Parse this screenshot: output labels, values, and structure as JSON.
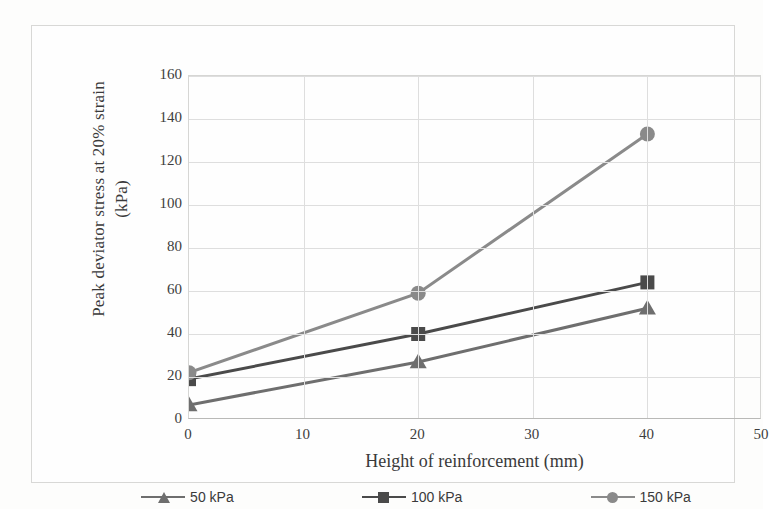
{
  "chart_data": {
    "type": "line",
    "title": "",
    "xlabel": "Height of reinforcement (mm)",
    "ylabel": "Peak deviator stress at  20% strain (kPa)",
    "ylabel_line1": "Peak deviator stress at  20% strain",
    "ylabel_line2": "(kPa)",
    "x": [
      0,
      20,
      40
    ],
    "xlim": [
      0,
      50
    ],
    "ylim": [
      0,
      160
    ],
    "xticks": [
      0,
      10,
      20,
      30,
      40,
      50
    ],
    "yticks": [
      0,
      20,
      40,
      60,
      80,
      100,
      120,
      140,
      160
    ],
    "grid": "horizontal-and-vertical",
    "legend_position": "bottom",
    "series": [
      {
        "name": "50 kPa",
        "marker": "triangle",
        "color": "#6e6e6e",
        "values": [
          7,
          27,
          52
        ]
      },
      {
        "name": "100 kPa",
        "marker": "square",
        "color": "#4a4a4a",
        "values": [
          19,
          40,
          64
        ]
      },
      {
        "name": "150 kPa",
        "marker": "circle",
        "color": "#8a8a8a",
        "values": [
          22,
          59,
          133
        ]
      }
    ]
  },
  "axis": {
    "y_ticks": [
      "160",
      "140",
      "120",
      "100",
      "80",
      "60",
      "40",
      "20",
      "0"
    ],
    "x_ticks": [
      "0",
      "10",
      "20",
      "30",
      "40",
      "50"
    ]
  },
  "legend": {
    "items": [
      {
        "label": "50 kPa"
      },
      {
        "label": "100 kPa"
      },
      {
        "label": "150 kPa"
      }
    ]
  }
}
